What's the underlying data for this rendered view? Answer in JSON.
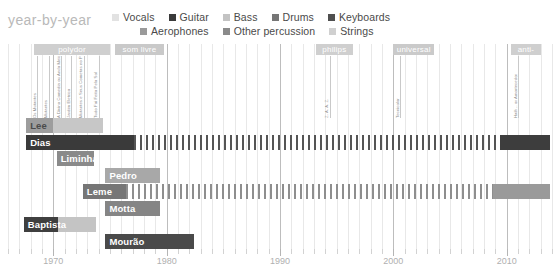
{
  "chart_data": {
    "type": "bar",
    "title": "year-by-year",
    "subtitle": "",
    "xlabel": "",
    "ylabel": "",
    "xlim": [
      1966,
      2014
    ],
    "grid": true,
    "legend_position": "top",
    "tick_labels": [
      "1970",
      "1980",
      "1990",
      "2000",
      "2010"
    ],
    "tick_values": [
      1970,
      1980,
      1990,
      2000,
      2010
    ],
    "legend": [
      {
        "name": "Vocals",
        "color": "#e2e2e2"
      },
      {
        "name": "Guitar",
        "color": "#3a3a3a"
      },
      {
        "name": "Bass",
        "color": "#c3c3c3"
      },
      {
        "name": "Drums",
        "color": "#767676"
      },
      {
        "name": "Keyboards",
        "color": "#4f4f4f"
      },
      {
        "name": "Aerophones",
        "color": "#9a9a9a"
      },
      {
        "name": "Other percussion",
        "color": "#8a8a8a"
      },
      {
        "name": "Strings",
        "color": "#d0d0d0"
      }
    ],
    "label_bands": [
      {
        "name": "polydor",
        "start": 1968.3,
        "end": 1975.0,
        "color": "#cfcfcf"
      },
      {
        "name": "som livre",
        "start": 1975.4,
        "end": 1979.8,
        "color": "#c9c9c9"
      },
      {
        "name": "philips",
        "start": 1993.2,
        "end": 1996.4,
        "color": "#cfcfcf"
      },
      {
        "name": "universal",
        "start": 2000.0,
        "end": 2003.6,
        "color": "#cacaca"
      },
      {
        "name": "anti-",
        "start": 2010.4,
        "end": 2013.0,
        "color": "#cfcfcf"
      }
    ],
    "albums": [
      {
        "name": "Os Mutantes",
        "year": 1968.6
      },
      {
        "name": "Mutantes",
        "year": 1969.6
      },
      {
        "name": "A Divina Comedia ou Ando Meio Desligado",
        "year": 1970.7
      },
      {
        "name": "Jardim Eletrico",
        "year": 1971.6
      },
      {
        "name": "Mutantes e Seus Cometas no Pais do Baurets",
        "year": 1972.7
      },
      {
        "name": "Tudo Foi Feito Pelo Sol",
        "year": 1974.0
      },
      {
        "name": "Z. A. A. Z.",
        "year": 1994.4
      },
      {
        "name": "Tecnicolor",
        "year": 2000.6
      },
      {
        "name": "Haih .. or Amortecedor",
        "year": 2011.0
      }
    ],
    "series": [
      {
        "name": "Lee",
        "label_align": "left",
        "label_color": "light",
        "segments": [
          {
            "start": 1967.6,
            "end": 1970.0,
            "color": "#9d9d9d",
            "pattern": "solid"
          },
          {
            "start": 1970.0,
            "end": 1974.4,
            "color": "#c7c7c7",
            "pattern": "solid"
          }
        ]
      },
      {
        "name": "Dias",
        "label_align": "left",
        "label_color": "dark",
        "segments": [
          {
            "start": 1967.6,
            "end": 1977.1,
            "color": "#3a3a3a",
            "pattern": "solid"
          },
          {
            "start": 1977.1,
            "end": 2009.4,
            "color": "#555555",
            "pattern": "striped"
          },
          {
            "start": 2009.4,
            "end": 2013.8,
            "color": "#3d3d3d",
            "pattern": "solid"
          }
        ]
      },
      {
        "name": "Liminha",
        "label_align": "left",
        "label_color": "dark",
        "segments": [
          {
            "start": 1970.3,
            "end": 1973.6,
            "color": "#8a8a8a",
            "pattern": "solid"
          }
        ]
      },
      {
        "name": "Pedro",
        "label_align": "left",
        "label_color": "dark",
        "segments": [
          {
            "start": 1974.6,
            "end": 1979.4,
            "color": "#a8a8a8",
            "pattern": "solid"
          }
        ]
      },
      {
        "name": "Leme",
        "label_align": "left",
        "label_color": "dark",
        "segments": [
          {
            "start": 1972.6,
            "end": 1976.4,
            "color": "#767676",
            "pattern": "solid"
          },
          {
            "start": 1976.4,
            "end": 2008.8,
            "color": "#8e8e8e",
            "pattern": "striped"
          },
          {
            "start": 2008.8,
            "end": 2013.8,
            "color": "#9a9a9a",
            "pattern": "solid"
          }
        ]
      },
      {
        "name": "Motta",
        "label_align": "left",
        "label_color": "dark",
        "segments": [
          {
            "start": 1974.6,
            "end": 1979.4,
            "color": "#858585",
            "pattern": "solid"
          }
        ]
      },
      {
        "name": "Baptista",
        "label_align": "left",
        "label_color": "dark",
        "segments": [
          {
            "start": 1967.4,
            "end": 1970.4,
            "color": "#3f3f3f",
            "pattern": "solid"
          },
          {
            "start": 1970.4,
            "end": 1973.8,
            "color": "#c4c4c4",
            "pattern": "solid"
          }
        ]
      },
      {
        "name": "Mourão",
        "label_align": "left",
        "label_color": "dark",
        "segments": [
          {
            "start": 1974.6,
            "end": 1982.4,
            "color": "#4a4a4a",
            "pattern": "solid"
          }
        ]
      }
    ]
  }
}
